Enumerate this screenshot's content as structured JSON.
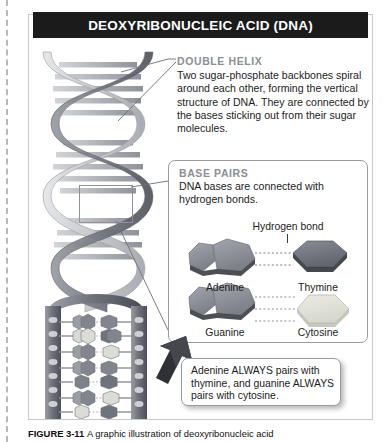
{
  "figure": {
    "title": "DEOXYRIBONUCLEIC ACID (DNA)",
    "caption_prefix": "FIGURE 3-11",
    "caption_text": "A graphic illustration of deoxyribonucleic acid"
  },
  "double_helix": {
    "heading": "DOUBLE HELIX",
    "body": "Two sugar-phosphate backbones spiral around each other, forming the vertical structure of DNA. They are connected by the bases sticking out from their sugar molecules."
  },
  "base_pairs": {
    "heading": "BASE PAIRS",
    "body": "DNA bases are connected with hydrogen bonds.",
    "hydrogen_bond_label": "Hydrogen bond",
    "bases": [
      {
        "name": "Adenine",
        "pair": "purine",
        "side": "left",
        "color": "#8d9098"
      },
      {
        "name": "Thymine",
        "pair": "pyrimidine",
        "side": "right",
        "color": "#6e7179"
      },
      {
        "name": "Guanine",
        "pair": "purine",
        "side": "left",
        "color": "#8d9098"
      },
      {
        "name": "Cytosine",
        "pair": "pyrimidine",
        "side": "right",
        "color": "#dcdcd4"
      }
    ]
  },
  "callout": {
    "text": "Adenine ALWAYS pairs with thymine, and guanine ALWAYS pairs with cytosine."
  },
  "colors": {
    "title_bar": "#1b1b1b",
    "title_text": "#ffffff",
    "heading_gray": "#8d8f93",
    "body_text": "#1d1d1d",
    "frame_border": "#c9c9c9",
    "panel_border": "#9b9b9b",
    "helix_light": "#c9cbce",
    "helix_dark": "#8a8d93",
    "arrow": "#2f2f33"
  }
}
